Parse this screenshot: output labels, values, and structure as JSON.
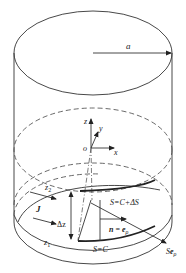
{
  "figure": {
    "labels": {
      "radius": "a",
      "axis_z": "z",
      "axis_y": "y",
      "axis_x": "x",
      "origin": "o",
      "z2": "z",
      "z2_sub": "2",
      "z1": "z",
      "z1_sub": "1",
      "current": "J",
      "delta_z": "Δz",
      "surface_upper": "S=C+ΔS",
      "surface_lower": "S=C",
      "normal_n": "n",
      "normal_eq": " = ",
      "normal_e": "e",
      "normal_sub": "ρ",
      "surface_vec_S": "S",
      "surface_vec_e": "e",
      "surface_vec_sub": "ρ"
    },
    "colors": {
      "stroke": "#333333",
      "background": "#ffffff"
    }
  }
}
